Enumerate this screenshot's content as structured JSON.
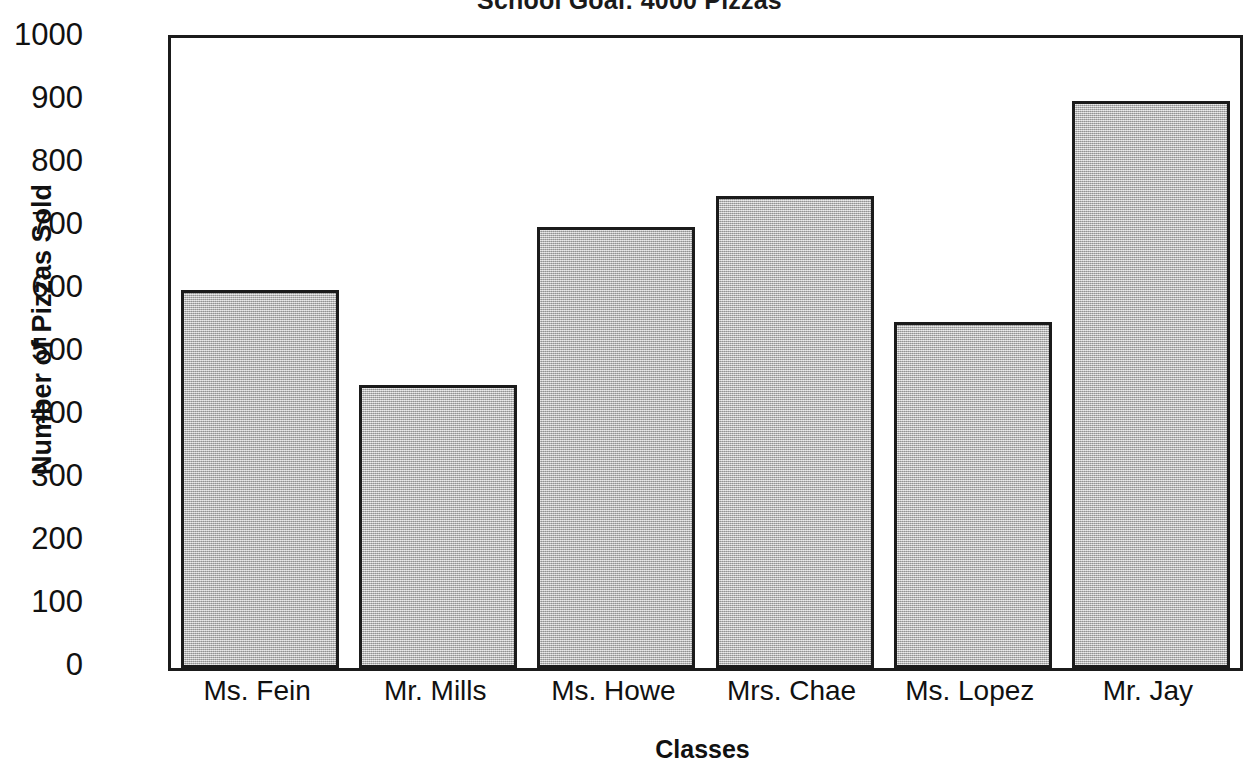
{
  "chart_data": {
    "type": "bar",
    "title": "School Goal: 4000 Pizzas",
    "xlabel": "Classes",
    "ylabel": "Number of Pizzas Sold",
    "categories": [
      "Ms. Fein",
      "Mr. Mills",
      "Ms. Howe",
      "Mrs. Chae",
      "Ms. Lopez",
      "Mr. Jay"
    ],
    "values": [
      600,
      450,
      700,
      750,
      550,
      900
    ],
    "ylim": [
      0,
      1000
    ],
    "ytick_labels": [
      "1000",
      "900",
      "800",
      "700",
      "600",
      "500",
      "400",
      "300",
      "200",
      "100",
      "0"
    ],
    "ytick_values": [
      1000,
      900,
      800,
      700,
      600,
      500,
      400,
      300,
      200,
      100,
      0
    ],
    "grid": false,
    "legend": false,
    "bar_fill_color": "#b4b4b4",
    "bar_edge_color": "#1b1b1b",
    "axis_color": "#1b1b1b",
    "background_color": "#ffffff"
  }
}
